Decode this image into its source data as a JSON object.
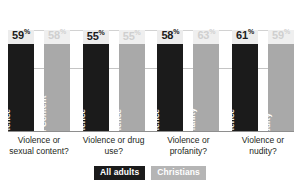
{
  "chart_data": {
    "type": "bar",
    "title": "",
    "xlabel": "",
    "ylabel": "",
    "ylim": [
      0,
      100
    ],
    "grid": true,
    "legend_position": "bottom",
    "categories": [
      "Violence or sexual content?",
      "Violence or drug use?",
      "Violence or profanity?",
      "Violence or nudity?"
    ],
    "series": [
      {
        "name": "All adults",
        "values": [
          59,
          55,
          58,
          61
        ]
      },
      {
        "name": "Christians",
        "values": [
          58,
          55,
          63,
          59
        ]
      }
    ],
    "bar_inner_labels": [
      [
        "Violence",
        "Sexual Content"
      ],
      [
        "Violence",
        "Violence"
      ],
      [
        "Violence",
        "Profanity"
      ],
      [
        "Violence",
        "Nudity"
      ]
    ],
    "value_suffix": "%"
  },
  "groups": [
    {
      "category": "Violence or sexual content?",
      "bars": [
        {
          "series": "All adults",
          "value": "59",
          "suffix": "%",
          "inner_label": "Violence"
        },
        {
          "series": "Christians",
          "value": "58",
          "suffix": "%",
          "inner_label": "Sexual Content"
        }
      ]
    },
    {
      "category": "Violence or drug use?",
      "bars": [
        {
          "series": "All adults",
          "value": "55",
          "suffix": "%",
          "inner_label": "Violence"
        },
        {
          "series": "Christians",
          "value": "55",
          "suffix": "%",
          "inner_label": "Violence"
        }
      ]
    },
    {
      "category": "Violence or profanity?",
      "bars": [
        {
          "series": "All adults",
          "value": "58",
          "suffix": "%",
          "inner_label": "Violence"
        },
        {
          "series": "Christians",
          "value": "63",
          "suffix": "%",
          "inner_label": "Profanity"
        }
      ]
    },
    {
      "category": "Violence or nudity?",
      "bars": [
        {
          "series": "All adults",
          "value": "61",
          "suffix": "%",
          "inner_label": "Violence"
        },
        {
          "series": "Christians",
          "value": "59",
          "suffix": "%",
          "inner_label": "Nudity"
        }
      ]
    }
  ],
  "legend": [
    {
      "label": "All adults",
      "color": "#1b1b1b"
    },
    {
      "label": "Christians",
      "color": "#b5b5b5"
    }
  ],
  "colors": {
    "all_adults": "#1b1b1b",
    "christians": "#a9a9a9",
    "track": "#ececec",
    "gridline": "#c9c9c9",
    "axis": "#8e8e8e",
    "text": "#231f20"
  }
}
